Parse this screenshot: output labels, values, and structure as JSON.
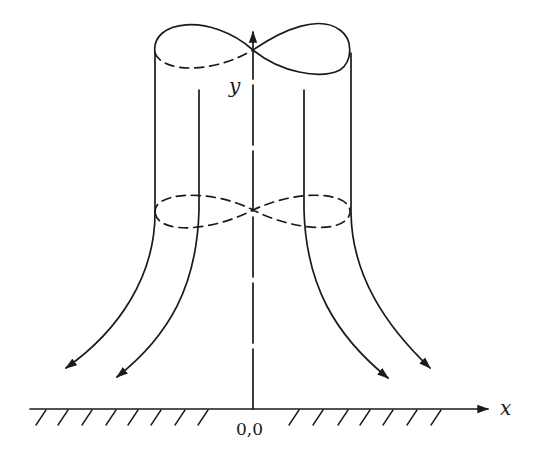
{
  "diagram": {
    "title": "",
    "labels": {
      "y_axis": "y",
      "x_axis": "x",
      "origin": "0,0"
    },
    "elements": [
      "vertical y-axis with arrow (long-dash line)",
      "horizontal x-axis with arrow",
      "hatched ground line (ground surface) on both sides of origin",
      "top figure-eight cross-section (solid front, dashed back-left)",
      "middle figure-eight cross-section (dashed)",
      "two outer cylinder walls curving outward into arrows",
      "two inner flow lines curving outward into arrows"
    ],
    "colors": {
      "ink": "#1a1a1a",
      "background": "#ffffff"
    }
  }
}
